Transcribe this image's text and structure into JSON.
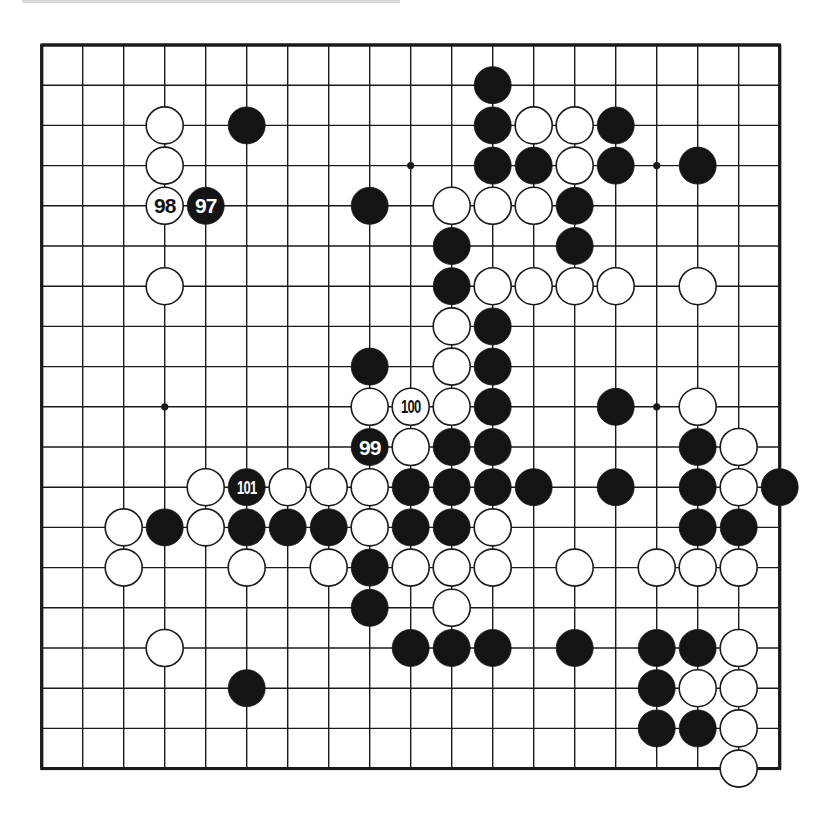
{
  "board": {
    "size": 19,
    "origin_x": 41.7,
    "origin_y": 45,
    "spacing_x": 41.0,
    "spacing_y": 40.2,
    "stone_radius": 18.5,
    "line_color": "#1a1a1a",
    "black_color": "#141414",
    "white_color": "#ffffff",
    "star_points": [
      [
        9,
        3
      ],
      [
        15,
        3
      ],
      [
        3,
        9
      ],
      [
        15,
        9
      ]
    ]
  },
  "stones": [
    {
      "col": 11,
      "row": 1,
      "color": "black"
    },
    {
      "col": 3,
      "row": 2,
      "color": "white"
    },
    {
      "col": 5,
      "row": 2,
      "color": "black"
    },
    {
      "col": 11,
      "row": 2,
      "color": "black"
    },
    {
      "col": 12,
      "row": 2,
      "color": "white"
    },
    {
      "col": 13,
      "row": 2,
      "color": "white"
    },
    {
      "col": 14,
      "row": 2,
      "color": "black"
    },
    {
      "col": 3,
      "row": 3,
      "color": "white"
    },
    {
      "col": 11,
      "row": 3,
      "color": "black"
    },
    {
      "col": 12,
      "row": 3,
      "color": "black"
    },
    {
      "col": 13,
      "row": 3,
      "color": "white"
    },
    {
      "col": 14,
      "row": 3,
      "color": "black"
    },
    {
      "col": 16,
      "row": 3,
      "color": "black"
    },
    {
      "col": 3,
      "row": 4,
      "color": "white",
      "label": "98"
    },
    {
      "col": 4,
      "row": 4,
      "color": "black",
      "label": "97"
    },
    {
      "col": 8,
      "row": 4,
      "color": "black"
    },
    {
      "col": 10,
      "row": 4,
      "color": "white"
    },
    {
      "col": 11,
      "row": 4,
      "color": "white"
    },
    {
      "col": 12,
      "row": 4,
      "color": "white"
    },
    {
      "col": 13,
      "row": 4,
      "color": "black"
    },
    {
      "col": 10,
      "row": 5,
      "color": "black"
    },
    {
      "col": 13,
      "row": 5,
      "color": "black"
    },
    {
      "col": 3,
      "row": 6,
      "color": "white"
    },
    {
      "col": 10,
      "row": 6,
      "color": "black"
    },
    {
      "col": 11,
      "row": 6,
      "color": "white"
    },
    {
      "col": 12,
      "row": 6,
      "color": "white"
    },
    {
      "col": 13,
      "row": 6,
      "color": "white"
    },
    {
      "col": 14,
      "row": 6,
      "color": "white"
    },
    {
      "col": 16,
      "row": 6,
      "color": "white"
    },
    {
      "col": 10,
      "row": 7,
      "color": "white"
    },
    {
      "col": 11,
      "row": 7,
      "color": "black"
    },
    {
      "col": 8,
      "row": 8,
      "color": "black"
    },
    {
      "col": 10,
      "row": 8,
      "color": "white"
    },
    {
      "col": 11,
      "row": 8,
      "color": "black"
    },
    {
      "col": 8,
      "row": 9,
      "color": "white"
    },
    {
      "col": 9,
      "row": 9,
      "color": "white",
      "label": "100"
    },
    {
      "col": 10,
      "row": 9,
      "color": "white"
    },
    {
      "col": 11,
      "row": 9,
      "color": "black"
    },
    {
      "col": 14,
      "row": 9,
      "color": "black"
    },
    {
      "col": 16,
      "row": 9,
      "color": "white"
    },
    {
      "col": 8,
      "row": 10,
      "color": "black",
      "label": "99"
    },
    {
      "col": 9,
      "row": 10,
      "color": "white"
    },
    {
      "col": 10,
      "row": 10,
      "color": "black"
    },
    {
      "col": 11,
      "row": 10,
      "color": "black"
    },
    {
      "col": 16,
      "row": 10,
      "color": "black"
    },
    {
      "col": 17,
      "row": 10,
      "color": "white"
    },
    {
      "col": 4,
      "row": 11,
      "color": "white"
    },
    {
      "col": 5,
      "row": 11,
      "color": "black",
      "label": "101"
    },
    {
      "col": 6,
      "row": 11,
      "color": "white"
    },
    {
      "col": 7,
      "row": 11,
      "color": "white"
    },
    {
      "col": 8,
      "row": 11,
      "color": "white"
    },
    {
      "col": 9,
      "row": 11,
      "color": "black"
    },
    {
      "col": 10,
      "row": 11,
      "color": "black"
    },
    {
      "col": 11,
      "row": 11,
      "color": "black"
    },
    {
      "col": 12,
      "row": 11,
      "color": "black"
    },
    {
      "col": 14,
      "row": 11,
      "color": "black"
    },
    {
      "col": 16,
      "row": 11,
      "color": "black"
    },
    {
      "col": 17,
      "row": 11,
      "color": "white"
    },
    {
      "col": 18,
      "row": 11,
      "color": "black"
    },
    {
      "col": 2,
      "row": 12,
      "color": "white"
    },
    {
      "col": 3,
      "row": 12,
      "color": "black"
    },
    {
      "col": 4,
      "row": 12,
      "color": "white"
    },
    {
      "col": 5,
      "row": 12,
      "color": "black"
    },
    {
      "col": 6,
      "row": 12,
      "color": "black"
    },
    {
      "col": 7,
      "row": 12,
      "color": "black"
    },
    {
      "col": 8,
      "row": 12,
      "color": "white"
    },
    {
      "col": 9,
      "row": 12,
      "color": "black"
    },
    {
      "col": 10,
      "row": 12,
      "color": "black"
    },
    {
      "col": 11,
      "row": 12,
      "color": "white"
    },
    {
      "col": 16,
      "row": 12,
      "color": "black"
    },
    {
      "col": 17,
      "row": 12,
      "color": "black"
    },
    {
      "col": 2,
      "row": 13,
      "color": "white"
    },
    {
      "col": 5,
      "row": 13,
      "color": "white"
    },
    {
      "col": 7,
      "row": 13,
      "color": "white"
    },
    {
      "col": 8,
      "row": 13,
      "color": "black"
    },
    {
      "col": 9,
      "row": 13,
      "color": "white"
    },
    {
      "col": 10,
      "row": 13,
      "color": "white"
    },
    {
      "col": 11,
      "row": 13,
      "color": "white"
    },
    {
      "col": 13,
      "row": 13,
      "color": "white"
    },
    {
      "col": 15,
      "row": 13,
      "color": "white"
    },
    {
      "col": 16,
      "row": 13,
      "color": "white"
    },
    {
      "col": 17,
      "row": 13,
      "color": "white"
    },
    {
      "col": 8,
      "row": 14,
      "color": "black"
    },
    {
      "col": 10,
      "row": 14,
      "color": "white"
    },
    {
      "col": 3,
      "row": 15,
      "color": "white"
    },
    {
      "col": 9,
      "row": 15,
      "color": "black"
    },
    {
      "col": 10,
      "row": 15,
      "color": "black"
    },
    {
      "col": 11,
      "row": 15,
      "color": "black"
    },
    {
      "col": 13,
      "row": 15,
      "color": "black"
    },
    {
      "col": 15,
      "row": 15,
      "color": "black"
    },
    {
      "col": 16,
      "row": 15,
      "color": "black"
    },
    {
      "col": 17,
      "row": 15,
      "color": "white"
    },
    {
      "col": 5,
      "row": 16,
      "color": "black"
    },
    {
      "col": 15,
      "row": 16,
      "color": "black"
    },
    {
      "col": 16,
      "row": 16,
      "color": "white"
    },
    {
      "col": 17,
      "row": 16,
      "color": "white"
    },
    {
      "col": 15,
      "row": 17,
      "color": "black"
    },
    {
      "col": 16,
      "row": 17,
      "color": "black"
    },
    {
      "col": 17,
      "row": 17,
      "color": "white"
    },
    {
      "col": 17,
      "row": 18,
      "color": "white"
    }
  ]
}
